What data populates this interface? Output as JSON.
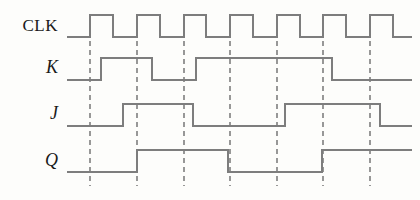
{
  "figure": {
    "type": "digital-timing-diagram",
    "title": "",
    "background_color": "#fdfdfb",
    "wave_color": "#7d7d7d",
    "dash_color": "#555555",
    "label_color": "#1a1a1a",
    "width": 420,
    "height": 200
  },
  "axis": {
    "wave_start_x": 67,
    "wave_end_x": 412,
    "clock_edge_xs": [
      90,
      137,
      184,
      230,
      277,
      323,
      370
    ],
    "clock_period_px": 46.7,
    "dashed_line_top_y": 14,
    "dashed_line_bottom_y": 186
  },
  "signals": [
    {
      "name": "CLK",
      "label": "CLK",
      "italic": false,
      "label_x": 58,
      "label_y": 26,
      "high_y": 15,
      "low_y": 37,
      "start_level": 0,
      "transitions": [
        {
          "x": 90,
          "level": 1
        },
        {
          "x": 113,
          "level": 0
        },
        {
          "x": 137,
          "level": 1
        },
        {
          "x": 160,
          "level": 0
        },
        {
          "x": 184,
          "level": 1
        },
        {
          "x": 206,
          "level": 0
        },
        {
          "x": 230,
          "level": 1
        },
        {
          "x": 253,
          "level": 0
        },
        {
          "x": 277,
          "level": 1
        },
        {
          "x": 300,
          "level": 0
        },
        {
          "x": 323,
          "level": 1
        },
        {
          "x": 346,
          "level": 0
        },
        {
          "x": 370,
          "level": 1
        },
        {
          "x": 393,
          "level": 0
        }
      ]
    },
    {
      "name": "K",
      "label": "K",
      "italic": true,
      "label_x": 58,
      "label_y": 67,
      "high_y": 58,
      "low_y": 80,
      "start_level": 0,
      "transitions": [
        {
          "x": 101,
          "level": 1
        },
        {
          "x": 152,
          "level": 0
        },
        {
          "x": 196,
          "level": 1
        },
        {
          "x": 332,
          "level": 0
        }
      ]
    },
    {
      "name": "J",
      "label": "J",
      "italic": true,
      "label_x": 58,
      "label_y": 113,
      "high_y": 104,
      "low_y": 126,
      "start_level": 0,
      "transitions": [
        {
          "x": 123,
          "level": 1
        },
        {
          "x": 193,
          "level": 0
        },
        {
          "x": 285,
          "level": 1
        },
        {
          "x": 380,
          "level": 0
        }
      ]
    },
    {
      "name": "Q",
      "label": "Q",
      "italic": true,
      "label_x": 58,
      "label_y": 160,
      "high_y": 150,
      "low_y": 172,
      "start_level": 0,
      "transitions": [
        {
          "x": 137,
          "level": 1
        },
        {
          "x": 228,
          "level": 0
        },
        {
          "x": 322,
          "level": 1
        }
      ]
    }
  ]
}
